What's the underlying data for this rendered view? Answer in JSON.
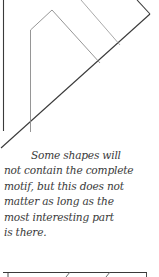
{
  "diagram": {
    "type": "hand-drawn patchwork motif template",
    "stroke_color": "#3a3a3a",
    "light_stroke_color": "#9a9a9a"
  },
  "caption": {
    "lines": [
      "Some shapes will",
      "not contain the complete",
      "motif, but this does not",
      "matter as long as the",
      "most interesting part",
      "is there."
    ]
  }
}
